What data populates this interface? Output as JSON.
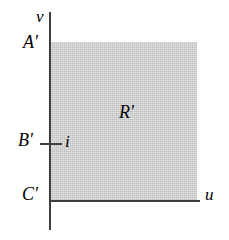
{
  "figure": {
    "background_color": "#ffffff",
    "axis_color": "#3f3f3f",
    "region_fill_color": "#bebebe"
  },
  "axes": {
    "vertical": {
      "label": "v"
    },
    "horizontal": {
      "label": "u"
    }
  },
  "labels": {
    "a_prime": "A′",
    "b_prime": "B′",
    "c_prime": "C′",
    "region": "R′",
    "tick_value": "i"
  },
  "chart_data": {
    "type": "area",
    "title": "",
    "xlabel": "u",
    "ylabel": "v",
    "grid": false,
    "legend": "none",
    "annotations": [
      {
        "text": "A′",
        "role": "y-axis-endpoint-label",
        "position": "left of v-axis at top of region"
      },
      {
        "text": "B′",
        "role": "y-axis-tick-label",
        "position": "left of v-axis, tick marked"
      },
      {
        "text": "C′",
        "role": "origin-label",
        "position": "left of v-axis at u-axis"
      },
      {
        "text": "i",
        "role": "tick-value",
        "position": "right of B′ tick mark"
      },
      {
        "text": "R′",
        "role": "region-label",
        "position": "inside shaded rectangle"
      }
    ],
    "regions": [
      {
        "name": "R′",
        "shape": "rectangle",
        "fill": "#bebebe",
        "x_range": [
          "C′",
          "right edge"
        ],
        "y_range": [
          "C′",
          "A′"
        ]
      }
    ]
  }
}
